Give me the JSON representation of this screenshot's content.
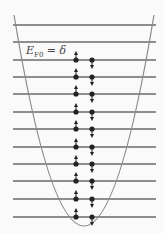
{
  "diagram": {
    "label": {
      "symbol": "E",
      "subscript": "F0",
      "rest": " = δ"
    },
    "levels_y": [
      25,
      42,
      60,
      77,
      94,
      112,
      129,
      147,
      164,
      181,
      199,
      217
    ],
    "occupied_levels_y": [
      60,
      77,
      94,
      112,
      129,
      147,
      164,
      181,
      199,
      217
    ],
    "electron_columns": {
      "spin_up_x": 76,
      "spin_down_x": 92
    },
    "colors": {
      "line": "#6a6a6a",
      "curve": "#8a8a8a",
      "electron": "#222222",
      "background": "#fafafa"
    }
  }
}
